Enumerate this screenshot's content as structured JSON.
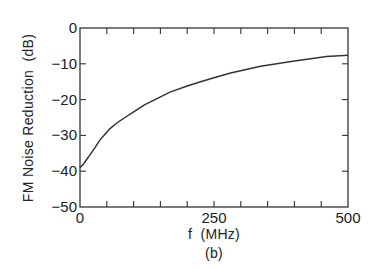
{
  "chart_data": {
    "type": "line",
    "title": "",
    "subtitle": "(b)",
    "xlabel": "f (MHz)",
    "ylabel": "FM Noise Reduction (dB)",
    "xlim": [
      0,
      500
    ],
    "ylim": [
      -50,
      0
    ],
    "xticks_labeled": [
      "0",
      "250",
      "500"
    ],
    "xticks_minor_count": 10,
    "yticks": [
      "0",
      "-10",
      "-20",
      "-30",
      "-40",
      "-50"
    ],
    "grid": false,
    "legend": null,
    "series": [
      {
        "name": "FM Noise Reduction",
        "x": [
          0,
          5,
          10,
          18,
          28,
          37,
          47,
          56,
          70,
          84,
          100,
          121,
          140,
          168,
          200,
          225,
          250,
          281,
          310,
          337,
          370,
          400,
          430,
          460,
          500
        ],
        "y": [
          -39,
          -38.3,
          -37.2,
          -35.6,
          -33.4,
          -31.3,
          -29.6,
          -28.1,
          -26.4,
          -25.0,
          -23.4,
          -21.4,
          -20.0,
          -17.9,
          -16.2,
          -15.0,
          -13.9,
          -12.6,
          -11.6,
          -10.7,
          -9.9,
          -9.2,
          -8.6,
          -8.0,
          -7.6
        ]
      }
    ]
  },
  "labels": {
    "x_axis": "f  (MHz)",
    "y_axis": "FM Noise Reduction  (dB)",
    "caption": "(b)",
    "x_ticks": [
      "0",
      "250",
      "500"
    ],
    "y_ticks": [
      "0",
      "-10",
      "-20",
      "-30",
      "-40",
      "-50"
    ]
  }
}
